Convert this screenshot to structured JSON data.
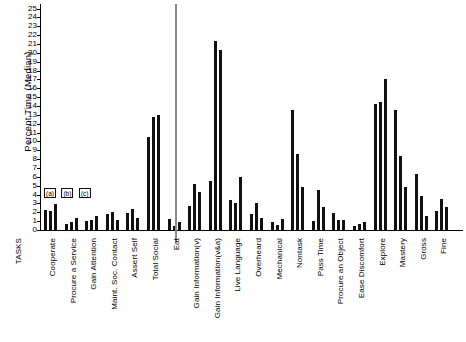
{
  "chart_data": {
    "type": "bar",
    "title": "",
    "xlabel": "TASKS",
    "ylabel": "Percent Time (Median)",
    "ylim": [
      0,
      25
    ],
    "yticks": [
      0,
      1,
      2,
      3,
      4,
      5,
      6,
      7,
      8,
      9,
      10,
      11,
      12,
      13,
      14,
      15,
      16,
      17,
      18,
      19,
      20,
      21,
      22,
      23,
      24,
      25
    ],
    "grid": false,
    "legend_position": "inside-left",
    "legend": [
      "(a)",
      "(b)",
      "(c)"
    ],
    "axis_title_left": "TASKS",
    "divider_after_category": "Total Social",
    "categories": [
      "Cooperate",
      "Procure a Service",
      "Gain Attention",
      "Maint. Soc. Contact",
      "Assert Self",
      "Total Social",
      "Eat",
      "Gain Information(v)",
      "Gain Information(v&a)",
      "Live Language",
      "Overheard",
      "Mechanical",
      "Nontask",
      "Pass Time",
      "Procure an Object",
      "Ease Discomfort",
      "Explore",
      "Mastery",
      "Gross",
      "Fine"
    ],
    "series": [
      {
        "name": "(a)",
        "values": [
          2.3,
          0.7,
          1.0,
          1.8,
          1.9,
          10.5,
          1.2,
          2.7,
          5.5,
          3.4,
          1.8,
          0.9,
          13.5,
          1.0,
          1.9,
          0.5,
          14.2,
          13.5,
          6.3,
          2.1
        ]
      },
      {
        "name": "(b)",
        "values": [
          2.2,
          0.9,
          1.1,
          2.0,
          2.4,
          12.8,
          0.5,
          5.2,
          21.3,
          3.0,
          3.1,
          0.6,
          8.6,
          4.5,
          1.1,
          0.7,
          14.5,
          8.3,
          3.8,
          3.5
        ]
      },
      {
        "name": "(c)",
        "values": [
          2.9,
          1.4,
          1.6,
          1.1,
          1.4,
          13.0,
          0.9,
          4.3,
          20.3,
          6.0,
          1.3,
          1.2,
          4.9,
          2.6,
          1.1,
          0.9,
          17.0,
          4.9,
          1.6,
          2.6
        ]
      }
    ]
  }
}
